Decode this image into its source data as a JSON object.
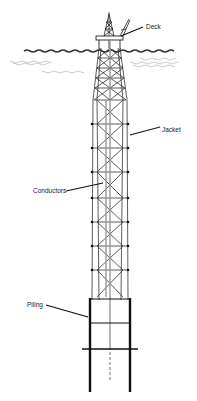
{
  "diagram": {
    "type": "offshore-platform-illustration",
    "labels": {
      "deck": "Deck",
      "jacket": "Jacket",
      "conductors": "Conductors",
      "piling": "Piling"
    },
    "colors": {
      "line": "#222222",
      "light_line": "#888888",
      "water": "#333333",
      "background": "#ffffff"
    }
  }
}
